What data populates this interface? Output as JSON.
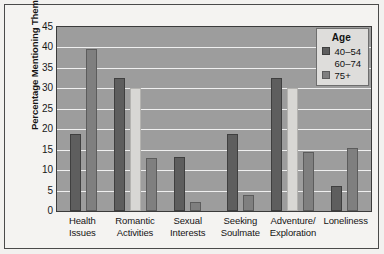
{
  "chart_data": {
    "type": "bar",
    "title": "",
    "xlabel": "",
    "ylabel": "Percentage Mentioning Theme",
    "ylim": [
      0,
      45
    ],
    "ytick_step": 5,
    "yticks": [
      45,
      40,
      35,
      30,
      25,
      20,
      15,
      10,
      5,
      0
    ],
    "grid": true,
    "legend_position": "top-right",
    "legend_title": "Age",
    "categories": [
      "Health Issues",
      "Romantic Activities",
      "Sexual Interests",
      "Seeking Soulmate",
      "Adventure/ Exploration",
      "Loneliness"
    ],
    "category_lines": [
      [
        "Health",
        "Issues"
      ],
      [
        "Romantic",
        "Activities"
      ],
      [
        "Sexual",
        "Interests"
      ],
      [
        "Seeking",
        "Soulmate"
      ],
      [
        "Adventure/",
        "Exploration"
      ],
      [
        "Loneliness",
        ""
      ]
    ],
    "series": [
      {
        "name": "40–54",
        "color": "#5e5e5e",
        "values": [
          18.8,
          32.5,
          13.2,
          18.8,
          32.5,
          6.2
        ]
      },
      {
        "name": "60–74",
        "color": "#d8d7d4",
        "values": [
          0,
          30.0,
          0,
          0,
          30.0,
          0
        ]
      },
      {
        "name": "75+",
        "color": "#7f7f7f",
        "values": [
          39.6,
          13.0,
          2.2,
          4.0,
          14.5,
          15.5
        ]
      }
    ]
  },
  "axis": {
    "y_title": "Percentage Mentioning Theme"
  },
  "legend": {
    "title": "Age",
    "items": [
      {
        "label": "40–54"
      },
      {
        "label": "60–74"
      },
      {
        "label": "75+"
      }
    ]
  },
  "colors": {
    "plot_background": "#9d9d9d",
    "gridline": "#efefef",
    "frame_border": "#4a4a4a",
    "figure_background": "#f4f3f1",
    "series_40_54": "#5e5e5e",
    "series_60_74": "#d8d7d4",
    "series_75_plus": "#7f7f7f",
    "legend_background": "#dedddb"
  }
}
